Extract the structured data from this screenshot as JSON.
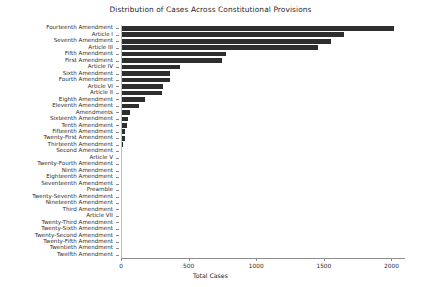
{
  "chart_data": {
    "type": "bar",
    "orientation": "horizontal",
    "title": "Distribution of Cases Across Constitutional Provisions",
    "xlabel": "Total Cases",
    "ylabel": "",
    "xlim": [
      0,
      2100
    ],
    "xticks": [
      0,
      500,
      1000,
      1500,
      2000
    ],
    "xtick_labels": [
      "0",
      "500",
      "1000",
      "1500",
      "2000"
    ],
    "grid": "vertical-white",
    "legend": "none",
    "bar_color": "#2e2e2e",
    "categories": [
      "Fourteenth Amendment",
      "Article I",
      "Seventh Amendment",
      "Article III",
      "Fifth Amendment",
      "First Amendment",
      "Article IV",
      "Sixth Amendment",
      "Fourth Amendment",
      "Article VI",
      "Article II",
      "Eighth Amendment",
      "Eleventh Amendment",
      "Amendments",
      "Sixteenth Amendment",
      "Tenth Amendment",
      "Fifteenth Amendment",
      "Twenty-First Amendment",
      "Thirteenth Amendment",
      "Second Amendment",
      "Article V",
      "Twenty-Fourth Amendment",
      "Ninth Amendment",
      "Eighteenth Amendment",
      "Seventeenth Amendment",
      "Preamble",
      "Twenty-Seventh Amendment",
      "Nineteenth Amendment",
      "Third Amendment",
      "Article VII",
      "Twenty-Third Amendment",
      "Twenty-Sixth Amendment",
      "Twenty-Second Amendment",
      "Twenty-Fifth Amendment",
      "Twentieth Amendment",
      "Twelfth Amendment"
    ],
    "values": [
      2015,
      1650,
      1550,
      1455,
      780,
      745,
      435,
      365,
      360,
      310,
      305,
      175,
      130,
      70,
      52,
      48,
      32,
      30,
      18,
      10,
      9,
      6,
      5,
      4,
      4,
      3,
      3,
      2,
      2,
      2,
      1,
      1,
      1,
      1,
      1,
      0
    ]
  }
}
